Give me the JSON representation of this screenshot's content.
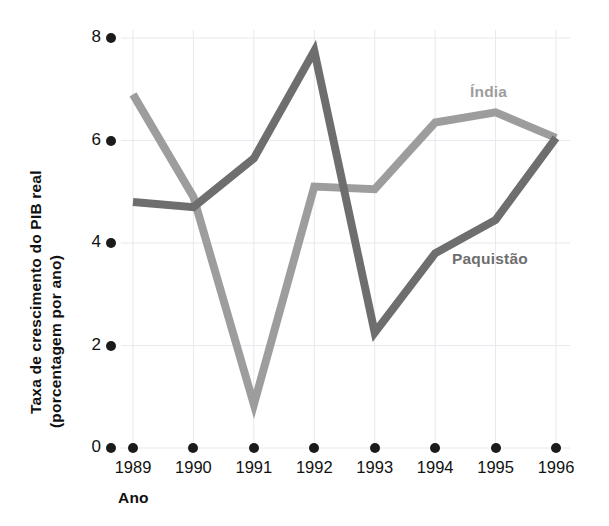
{
  "chart_data": {
    "type": "line",
    "title": "",
    "xlabel": "Ano",
    "ylabel_line1": "Taxa de crescimento do PIB real",
    "ylabel_line2": "(porcentagem por ano)",
    "categories": [
      "1989",
      "1990",
      "1991",
      "1992",
      "1993",
      "1994",
      "1995",
      "1996"
    ],
    "x": [
      1989,
      1990,
      1991,
      1992,
      1993,
      1994,
      1995,
      1996
    ],
    "ylim": [
      0,
      8
    ],
    "yticks": [
      "0",
      "2",
      "4",
      "6",
      "8"
    ],
    "ytick_values": [
      0,
      2,
      4,
      6,
      8
    ],
    "grid": true,
    "legend_position": "inline-right",
    "series": [
      {
        "name": "Índia",
        "color": "#9d9d9d",
        "values": [
          6.9,
          4.9,
          0.85,
          5.1,
          5.05,
          6.35,
          6.55,
          6.05
        ],
        "label_x": 470,
        "label_y": 83
      },
      {
        "name": "Paquistão",
        "color": "#6e6e6e",
        "values": [
          4.8,
          4.7,
          5.65,
          7.75,
          2.25,
          3.8,
          4.45,
          6.05
        ],
        "label_x": 452,
        "label_y": 250
      }
    ]
  },
  "axes": {
    "x_pixel_start": 133,
    "x_pixel_step": 60.43,
    "y_pixel_zero": 448,
    "y_pixel_per_unit": 51.25,
    "grid_color": "#e8e8ee",
    "tick_dot_color": "#1b1b1b"
  }
}
